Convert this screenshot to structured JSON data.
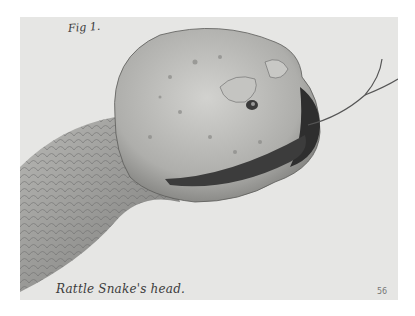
{
  "plate": {
    "figure_label": "Fig 1.",
    "caption": "Rattle Snake's head.",
    "page_number": "56",
    "subject": "rattlesnake head engraving",
    "colors": {
      "paper": "#e6e6e4",
      "page": "#ffffff",
      "ink": "#3a3a3a",
      "shadow": "#555555"
    }
  }
}
